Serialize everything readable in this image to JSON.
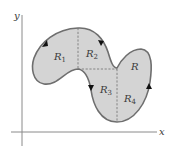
{
  "diagram": {
    "type": "region-decomposition",
    "axes": {
      "x_label": "x",
      "y_label": "y",
      "color": "#8a8a8a"
    },
    "region": {
      "label": "R",
      "fill": "#d4d4d4",
      "stroke": "#6e6e6e",
      "orientation": "counterclockwise"
    },
    "subregions": [
      {
        "base": "R",
        "sub": "1"
      },
      {
        "base": "R",
        "sub": "2"
      },
      {
        "base": "R",
        "sub": "3"
      },
      {
        "base": "R",
        "sub": "4"
      }
    ],
    "dashed_color": "#6e6e6e",
    "arrow_color": "#111111"
  }
}
